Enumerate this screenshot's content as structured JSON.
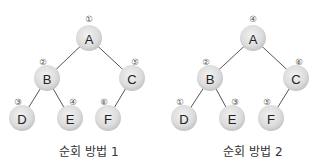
{
  "colors": {
    "node_fill_light": "#eeeeee",
    "node_fill_dark": "#c9c9c9",
    "edge": "#555555",
    "text": "#222222"
  },
  "trees": [
    {
      "caption": "순회 방법 1",
      "nodes": [
        {
          "id": "A",
          "label": "A",
          "order": "①",
          "cx": 89,
          "cy": 38
        },
        {
          "id": "B",
          "label": "B",
          "order": "②",
          "cx": 47,
          "cy": 78
        },
        {
          "id": "C",
          "label": "C",
          "order": "⑤",
          "cx": 132,
          "cy": 78
        },
        {
          "id": "D",
          "label": "D",
          "order": "③",
          "cx": 22,
          "cy": 118
        },
        {
          "id": "E",
          "label": "E",
          "order": "④",
          "cx": 70,
          "cy": 118
        },
        {
          "id": "F",
          "label": "F",
          "order": "⑥",
          "cx": 108,
          "cy": 118
        }
      ],
      "edges": [
        [
          "A",
          "B"
        ],
        [
          "A",
          "C"
        ],
        [
          "B",
          "D"
        ],
        [
          "B",
          "E"
        ],
        [
          "C",
          "F"
        ]
      ]
    },
    {
      "caption": "순회 방법 2",
      "nodes": [
        {
          "id": "A",
          "label": "A",
          "order": "④",
          "cx": 253,
          "cy": 38
        },
        {
          "id": "B",
          "label": "B",
          "order": "②",
          "cx": 210,
          "cy": 78
        },
        {
          "id": "C",
          "label": "C",
          "order": "⑥",
          "cx": 296,
          "cy": 78
        },
        {
          "id": "D",
          "label": "D",
          "order": "①",
          "cx": 184,
          "cy": 118
        },
        {
          "id": "E",
          "label": "E",
          "order": "③",
          "cx": 232,
          "cy": 118
        },
        {
          "id": "F",
          "label": "F",
          "order": "⑤",
          "cx": 271,
          "cy": 118
        }
      ],
      "edges": [
        [
          "A",
          "B"
        ],
        [
          "A",
          "C"
        ],
        [
          "B",
          "D"
        ],
        [
          "B",
          "E"
        ],
        [
          "C",
          "F"
        ]
      ]
    }
  ]
}
